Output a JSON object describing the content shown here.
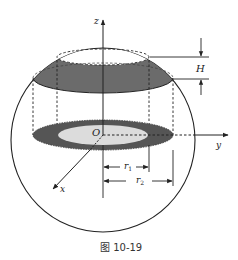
{
  "figure": {
    "caption": "图 10-19",
    "labels": {
      "z_axis": "z",
      "y_axis": "y",
      "x_axis": "x",
      "origin": "O",
      "height": "H",
      "r1": "r",
      "r1_sub": "1",
      "r2": "r",
      "r2_sub": "2"
    },
    "colors": {
      "line": "#222222",
      "band_fill": "#6b6b6b",
      "inner_disk_fill": "#dcdcdc",
      "background": "#ffffff"
    }
  }
}
